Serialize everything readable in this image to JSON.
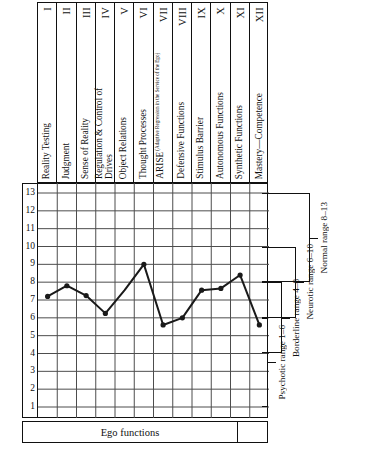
{
  "figure": {
    "bottom_axis_label": "Ego functions",
    "y_axis_ticks": [
      13,
      12,
      11,
      10,
      9,
      8,
      7,
      6,
      5,
      4,
      3,
      2,
      1
    ]
  },
  "columns": [
    {
      "numeral": "I",
      "label": "Reality Testing"
    },
    {
      "numeral": "II",
      "label": "Judgment"
    },
    {
      "numeral": "III",
      "label": "Sense of Reality"
    },
    {
      "numeral": "IV",
      "label": "Regulation & Control of Drives"
    },
    {
      "numeral": "V",
      "label": "Object Relations"
    },
    {
      "numeral": "VI",
      "label": "Thought Processes"
    },
    {
      "numeral": "VII",
      "label": "ARISE",
      "sublabel": "(Adaptive Regression in the Service of the Ego)"
    },
    {
      "numeral": "VIII",
      "label": "Defensive Functions"
    },
    {
      "numeral": "IX",
      "label": "Stimulus Barrier"
    },
    {
      "numeral": "X",
      "label": "Autonomous Functions"
    },
    {
      "numeral": "XI",
      "label": "Synthetic Functions"
    },
    {
      "numeral": "XII",
      "label": "Mastery—Competence"
    }
  ],
  "ranges": [
    {
      "name": "psychotic",
      "label": "Psychotic range 1–6",
      "low": 1,
      "high": 6
    },
    {
      "name": "borderline",
      "label": "Borderline range 4–8",
      "low": 4,
      "high": 8
    },
    {
      "name": "neurotic",
      "label": "Neurotic range 6–10",
      "low": 6,
      "high": 10
    },
    {
      "name": "normal",
      "label": "Normal range 8–13",
      "low": 8,
      "high": 13
    }
  ],
  "chart_data": {
    "type": "line",
    "title": "",
    "xlabel": "Ego functions",
    "ylabel": "",
    "ylim": [
      1,
      13
    ],
    "grid": true,
    "legend": "none",
    "categories": [
      "Reality Testing",
      "Judgment",
      "Sense of Reality",
      "Regulation & Control of Drives",
      "Object Relations",
      "Thought Processes",
      "ARISE",
      "Defensive Functions",
      "Stimulus Barrier",
      "Autonomous Functions",
      "Synthetic Functions",
      "Mastery—Competence"
    ],
    "x": [
      "I",
      "II",
      "III",
      "IV",
      "V",
      "VI",
      "VII",
      "VIII",
      "IX",
      "X",
      "XI",
      "XII"
    ],
    "values": [
      7.2,
      7.8,
      7.25,
      6.25,
      7.55,
      9.0,
      5.6,
      6.0,
      7.55,
      7.65,
      8.4,
      5.6
    ],
    "markers_shown": [
      true,
      true,
      true,
      true,
      false,
      true,
      true,
      true,
      true,
      true,
      true,
      true
    ],
    "tick_labels": [
      "13",
      "12",
      "11",
      "10",
      "9",
      "8",
      "7",
      "6",
      "5",
      "4",
      "3",
      "2",
      "1"
    ]
  },
  "colors": {
    "line": "#1a1a1a",
    "grid": "#4d4d4d",
    "frame": "#111111",
    "background": "#ffffff"
  }
}
